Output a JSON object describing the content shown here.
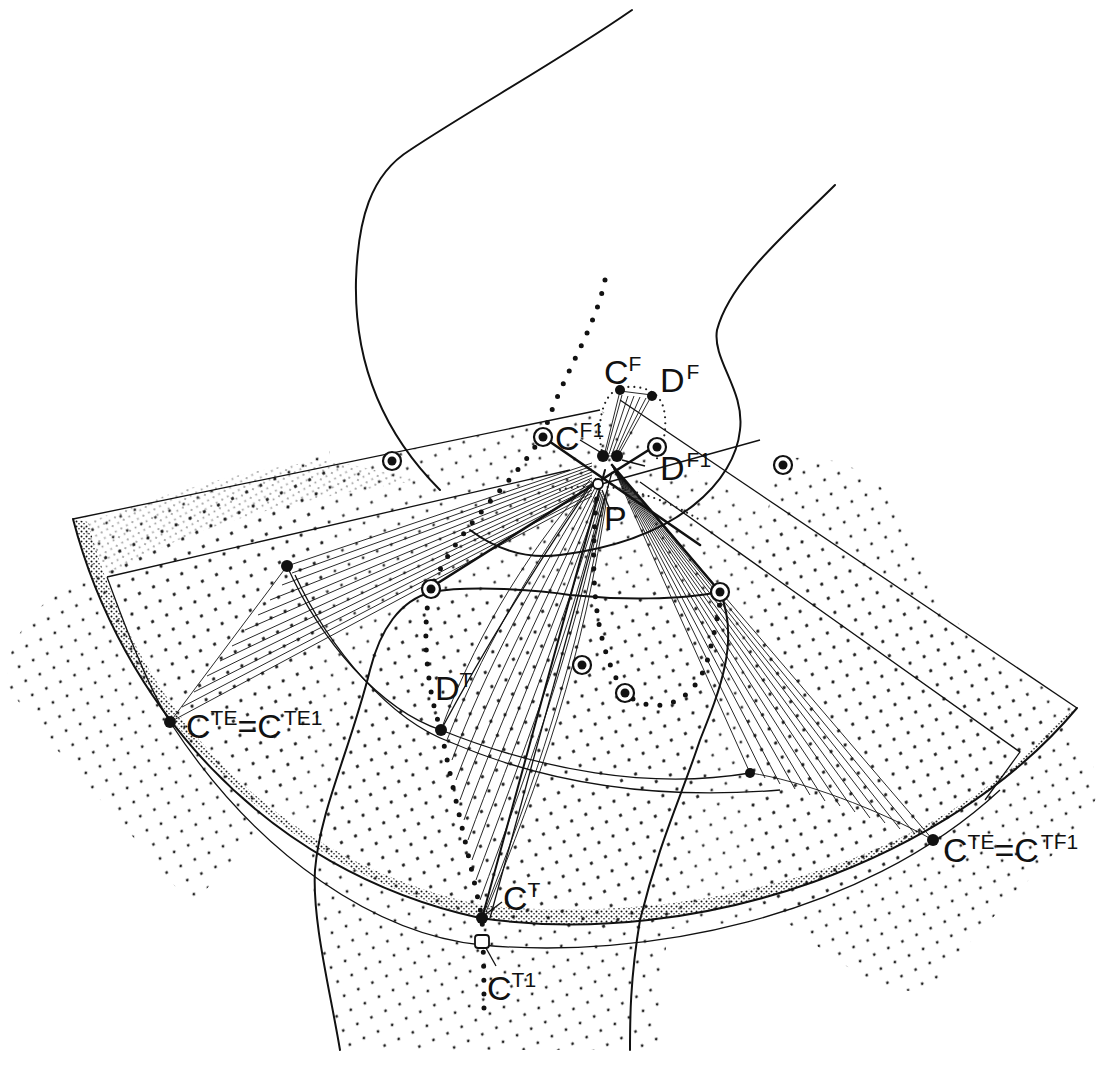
{
  "figure": {
    "type": "anatomical-mechanism-diagram"
  },
  "labels": {
    "CF": {
      "main": "C",
      "sup": "F"
    },
    "DF": {
      "main": "D",
      "sup": "F"
    },
    "CF1": {
      "main": "C",
      "sup": "F1"
    },
    "DF1": {
      "main": "D",
      "sup": "F1"
    },
    "P": {
      "main": "P",
      "sup": ""
    },
    "DT": {
      "main": "D",
      "sup": "T"
    },
    "CT": {
      "main": "C",
      "sup": "T"
    },
    "CT1": {
      "main": "C",
      "sup": "T1"
    },
    "left_eq": {
      "a_main": "C",
      "a_sup": "TE",
      "eq": "=",
      "b_main": "C",
      "b_sup": "TE1"
    },
    "right_eq": {
      "a_main": "C",
      "a_sup": "TE",
      "eq": "=",
      "b_main": "C",
      "b_sup": "TF1"
    }
  },
  "colors": {
    "ink": "#111111",
    "paper": "#ffffff"
  }
}
